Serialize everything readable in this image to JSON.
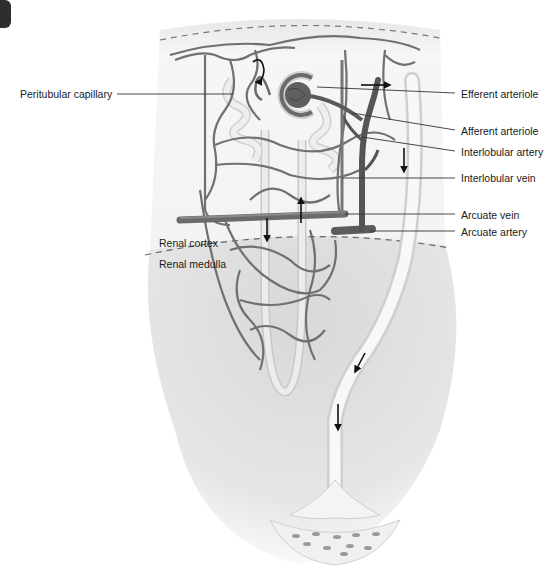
{
  "figure": {
    "corner_marker": "dark-tab"
  },
  "labels": {
    "left": [
      {
        "id": "peritubular-capillary",
        "text": "Peritubular capillary"
      }
    ],
    "right": [
      {
        "id": "efferent-arteriole",
        "text": "Efferent arteriole"
      },
      {
        "id": "afferent-arteriole",
        "text": "Afferent arteriole"
      },
      {
        "id": "interlobular-artery",
        "text": "Interlobular artery"
      },
      {
        "id": "interlobular-vein",
        "text": "Interlobular vein"
      },
      {
        "id": "arcuate-vein",
        "text": "Arcuate vein"
      },
      {
        "id": "arcuate-artery",
        "text": "Arcuate artery"
      }
    ],
    "regions": [
      {
        "id": "renal-cortex",
        "text": "Renal cortex"
      },
      {
        "id": "renal-medulla",
        "text": "Renal medulla"
      }
    ]
  },
  "colors": {
    "vessel": "#6e6e6e",
    "vessel_dark": "#555555",
    "tubule": "#e4e4e4",
    "tubule_edge": "#c4c4c4",
    "medulla": "#e2e2e2",
    "cortex": "#f4f4f4",
    "glomerulus": "#5f5f5f",
    "arrow": "#111111",
    "leader": "#333333"
  }
}
